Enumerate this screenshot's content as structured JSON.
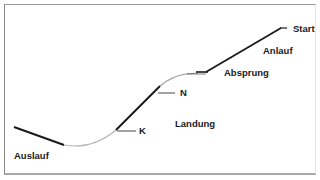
{
  "diagram": {
    "type": "ski-jump-profile",
    "labels": {
      "start": "Start",
      "anlauf": "Anlauf",
      "absprung": "Absprung",
      "n_point": "N",
      "landung": "Landung",
      "k_point": "K",
      "auslauf": "Auslauf"
    },
    "colors": {
      "line": "#1a1a1a",
      "curve": "#b0b0b0",
      "border": "#9a9a9a",
      "background": "#ffffff"
    }
  }
}
